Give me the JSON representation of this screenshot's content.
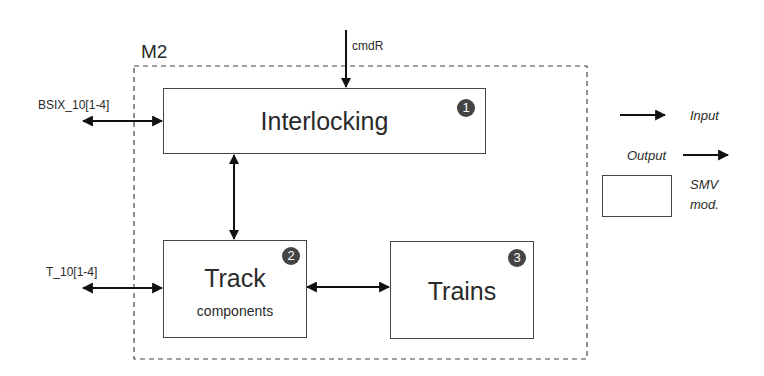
{
  "module": {
    "label": "M2"
  },
  "blocks": [
    {
      "id": 1,
      "title": "Interlocking",
      "subtitle": "",
      "badge": "1"
    },
    {
      "id": 2,
      "title": "Track",
      "subtitle": "components",
      "badge": "2"
    },
    {
      "id": 3,
      "title": "Trains",
      "subtitle": "",
      "badge": "3"
    }
  ],
  "signals": {
    "cmd": "cmdR",
    "bsix": "BSIX_10[1-4]",
    "track": "T_10[1-4]"
  },
  "legend": {
    "input": "Input",
    "output": "Output",
    "module_line1": "SMV",
    "module_line2": "mod."
  },
  "connections": [
    {
      "from": "cmdR",
      "to": "Interlocking",
      "direction": "input"
    },
    {
      "from": "BSIX_10[1-4]",
      "to": "Interlocking",
      "direction": "bidirectional"
    },
    {
      "from": "Interlocking",
      "to": "Track components",
      "direction": "bidirectional"
    },
    {
      "from": "T_10[1-4]",
      "to": "Track components",
      "direction": "bidirectional"
    },
    {
      "from": "Track components",
      "to": "Trains",
      "direction": "bidirectional"
    }
  ]
}
